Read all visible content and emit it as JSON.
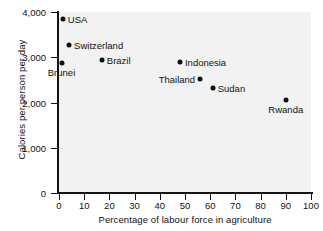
{
  "chart_data": {
    "type": "scatter",
    "title": "",
    "xlabel": "Percentage of labour force in agriculture",
    "ylabel": "Calories per person per day",
    "xlim": [
      0,
      100
    ],
    "ylim": [
      0,
      4000
    ],
    "xticks": [
      0,
      10,
      20,
      30,
      40,
      50,
      60,
      70,
      80,
      90,
      100
    ],
    "xtick_labels": [
      "0",
      "10",
      "20",
      "30",
      "40",
      "50",
      "60",
      "70",
      "80",
      "90",
      "100"
    ],
    "yticks": [
      0,
      1000,
      2000,
      3000,
      4000
    ],
    "ytick_labels": [
      "0",
      "1,000",
      "2,000",
      "3,000",
      "4,000"
    ],
    "grid": false,
    "legend": "none",
    "marker_color": "#101010",
    "plot_background": "#f2f2f2",
    "points": [
      {
        "label": "USA",
        "x": 1.5,
        "y": 3850,
        "label_pos": "right"
      },
      {
        "label": "Switzerland",
        "x": 4,
        "y": 3280,
        "label_pos": "right"
      },
      {
        "label": "Brunei",
        "x": 1,
        "y": 2880,
        "label_pos": "below"
      },
      {
        "label": "Brazil",
        "x": 17,
        "y": 2950,
        "label_pos": "right"
      },
      {
        "label": "Indonesia",
        "x": 48,
        "y": 2900,
        "label_pos": "right"
      },
      {
        "label": "Thailand",
        "x": 56,
        "y": 2520,
        "label_pos": "left"
      },
      {
        "label": "Sudan",
        "x": 61,
        "y": 2330,
        "label_pos": "right"
      },
      {
        "label": "Rwanda",
        "x": 90,
        "y": 2060,
        "label_pos": "below"
      }
    ]
  }
}
